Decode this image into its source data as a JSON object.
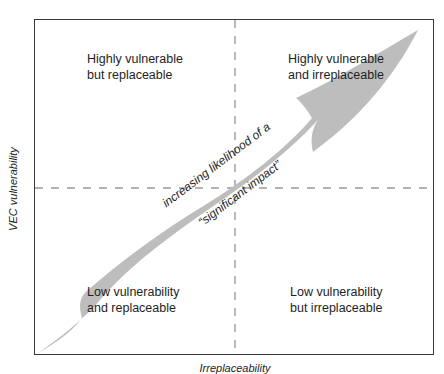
{
  "diagram": {
    "type": "quadrant-matrix",
    "axes": {
      "y_label": "VEC vulnerability",
      "x_label": "Irreplaceability"
    },
    "quadrants": {
      "top_left": {
        "line1": "Highly vulnerable",
        "line2": "but replaceable"
      },
      "top_right": {
        "line1": "Highly vulnerable",
        "line2": "and irreplaceable"
      },
      "bottom_left": {
        "line1": "Low vulnerability",
        "line2": "and replaceable"
      },
      "bottom_right": {
        "line1": "Low vulnerability",
        "line2": "but irreplaceable"
      }
    },
    "arrow": {
      "label_line1": "increasing likelihood of a",
      "label_line2": "“significant impact”",
      "direction": "bottom-left to top-right"
    },
    "colors": {
      "arrow_fill": "#bdbdbd",
      "frame": "#3a3a3a",
      "divider": "#9a9a9a",
      "text": "#1e1e1e"
    }
  }
}
